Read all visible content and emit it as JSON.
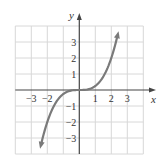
{
  "chart_data": {
    "type": "line",
    "title": "",
    "function": "y = x^3 / 4",
    "xlabel": "x",
    "ylabel": "y",
    "xlim": [
      -4,
      4
    ],
    "ylim": [
      -4,
      4
    ],
    "grid": true,
    "x_ticks": [
      -3,
      -2,
      1,
      2,
      3
    ],
    "x_tick_labels": [
      "−3",
      "−2",
      "1",
      "2",
      "3"
    ],
    "y_ticks": [
      3,
      2,
      1,
      -1,
      -2,
      -3
    ],
    "y_tick_labels": [
      "3",
      "2",
      "1",
      "−1",
      "−2",
      "−3"
    ],
    "series": [
      {
        "name": "curve",
        "x": [
          -2.5,
          -2,
          -1.5,
          -1,
          -0.5,
          0,
          0.5,
          1,
          1.5,
          2,
          2.5
        ],
        "y": [
          -3.9,
          -2,
          -0.84,
          -0.25,
          -0.03,
          0,
          0.03,
          0.25,
          0.84,
          2,
          3.9
        ],
        "arrows": "both ends"
      }
    ],
    "colors": {
      "curve": "#7a7a7a",
      "grid": "#d8d8d8",
      "axis": "#444444"
    }
  }
}
